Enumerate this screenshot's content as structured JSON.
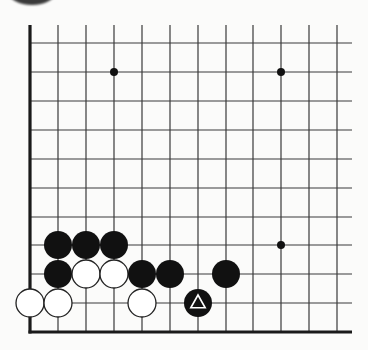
{
  "diagram": {
    "board": {
      "columns_x": [
        30,
        58,
        86,
        114,
        142,
        170,
        198,
        226,
        253,
        281,
        309,
        337
      ],
      "rows_y": [
        43,
        72,
        101,
        130,
        159,
        188,
        217,
        245,
        274,
        303,
        332
      ],
      "top_y": 25,
      "right_x": 352,
      "left_edge_x": 30,
      "bottom_edge_y": 332,
      "line_color": "#3a3a3a",
      "edge_color": "#1a1a1a"
    },
    "star_points": [
      {
        "x": 114,
        "y": 72
      },
      {
        "x": 281,
        "y": 72
      },
      {
        "x": 281,
        "y": 245
      }
    ],
    "black_stones": [
      {
        "x": 58,
        "y": 245
      },
      {
        "x": 86,
        "y": 245
      },
      {
        "x": 114,
        "y": 245
      },
      {
        "x": 58,
        "y": 274
      },
      {
        "x": 142,
        "y": 274
      },
      {
        "x": 170,
        "y": 274
      },
      {
        "x": 226,
        "y": 274
      },
      {
        "x": 198,
        "y": 303,
        "marker": "triangle"
      }
    ],
    "white_stones": [
      {
        "x": 86,
        "y": 274
      },
      {
        "x": 114,
        "y": 274
      },
      {
        "x": 30,
        "y": 303
      },
      {
        "x": 58,
        "y": 303
      },
      {
        "x": 142,
        "y": 303
      }
    ],
    "colors": {
      "black_stone": "#111111",
      "white_stone": "#ffffff",
      "stone_outline": "#222222",
      "background": "#fbfbfa"
    },
    "stone_radius": 14
  }
}
